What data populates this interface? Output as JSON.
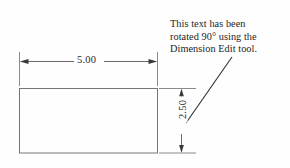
{
  "drawing": {
    "title": "Dimension Edit rotated text example",
    "background_color": "#fefefe",
    "line_color": "#6b6b6b",
    "text_color": "#1d1d1d",
    "shape": {
      "name": "rectangle",
      "width_value": "5.00",
      "height_value": "2.50"
    },
    "dimensions": {
      "horizontal": {
        "label": "5.00",
        "orientation": "horizontal",
        "rotation_degrees": 0
      },
      "vertical": {
        "label": "2.50",
        "orientation": "vertical",
        "rotation_degrees": 90
      }
    },
    "annotation": {
      "lines": [
        "This text has been",
        "rotated 90° using the",
        "Dimension Edit tool."
      ],
      "full_text": "This text has been rotated 90° using the Dimension Edit tool.",
      "leader": "diagonal-leader-line"
    }
  }
}
